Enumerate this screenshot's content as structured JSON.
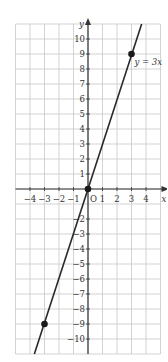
{
  "chart_data": {
    "type": "line",
    "title": "",
    "xlabel": "x",
    "ylabel": "y",
    "origin_label": "O",
    "xlim": [
      -5,
      5
    ],
    "ylim": [
      -11,
      11
    ],
    "grid": true,
    "x_ticks": [
      -4,
      -3,
      -2,
      -1,
      1,
      2,
      3,
      4
    ],
    "x_tick_labels": [
      "−4",
      "−3",
      "−2",
      "−1",
      "1",
      "2",
      "3",
      "4"
    ],
    "y_ticks": [
      10,
      9,
      8,
      7,
      6,
      5,
      4,
      3,
      2,
      1,
      -2,
      -3,
      -4,
      -5,
      -6,
      -7,
      -8,
      -9,
      -10
    ],
    "y_tick_labels": [
      "10",
      "9",
      "8",
      "7",
      "6",
      "5",
      "4",
      "3",
      "2",
      "1",
      "−2",
      "−3",
      "−4",
      "−5",
      "−6",
      "−7",
      "−8",
      "−9",
      "−10"
    ],
    "series": [
      {
        "name": "y = 3x",
        "label": "y = 3x",
        "equation": "y = 3x",
        "slope": 3,
        "intercept": 0,
        "x": [
          -3.7,
          3.7
        ],
        "y": [
          -11,
          11
        ]
      }
    ],
    "points": [
      {
        "x": 3,
        "y": 9
      },
      {
        "x": 0,
        "y": 0
      },
      {
        "x": -3,
        "y": -9
      }
    ],
    "annotations": [
      "y = 3x"
    ]
  },
  "colors": {
    "grid": "#c8c8c8",
    "axis": "#333333",
    "line": "#2a2a2a",
    "point": "#1a1a1a"
  },
  "labels": {
    "x_axis": "x",
    "y_axis": "y",
    "origin": "O",
    "equation": "y = 3x"
  }
}
